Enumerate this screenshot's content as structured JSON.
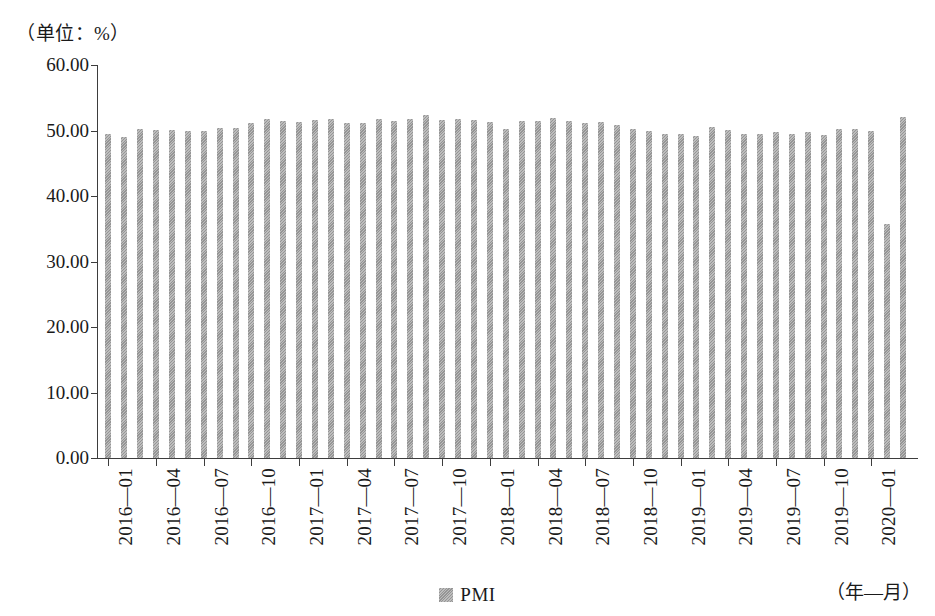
{
  "chart_data": {
    "type": "bar",
    "title": "",
    "unit_caption": "（单位：%）",
    "xlabel": "（年—月）",
    "ylabel": "",
    "grid": false,
    "legend_position": "bottom-center",
    "ylim": [
      0,
      60
    ],
    "ytick_labels": [
      "0.00",
      "10.00",
      "20.00",
      "30.00",
      "40.00",
      "50.00",
      "60.00"
    ],
    "ytick_values": [
      0,
      10,
      20,
      30,
      40,
      50,
      60
    ],
    "xtick_labels": [
      "2016—01",
      "2016—04",
      "2016—07",
      "2016—10",
      "2017—01",
      "2017—04",
      "2017—07",
      "2017—10",
      "2018—01",
      "2018—04",
      "2018—07",
      "2018—10",
      "2019—01",
      "2019—04",
      "2019—07",
      "2019—10",
      "2020—01"
    ],
    "xtick_indices": [
      0,
      3,
      6,
      9,
      12,
      15,
      18,
      21,
      24,
      27,
      30,
      33,
      36,
      39,
      42,
      45,
      48
    ],
    "series": [
      {
        "name": "PMI",
        "color": "#9d9d9d",
        "categories": [
          "2016-01",
          "2016-02",
          "2016-03",
          "2016-04",
          "2016-05",
          "2016-06",
          "2016-07",
          "2016-08",
          "2016-09",
          "2016-10",
          "2016-11",
          "2016-12",
          "2017-01",
          "2017-02",
          "2017-03",
          "2017-04",
          "2017-05",
          "2017-06",
          "2017-07",
          "2017-08",
          "2017-09",
          "2017-10",
          "2017-11",
          "2017-12",
          "2018-01",
          "2018-02",
          "2018-03",
          "2018-04",
          "2018-05",
          "2018-06",
          "2018-07",
          "2018-08",
          "2018-09",
          "2018-10",
          "2018-11",
          "2018-12",
          "2019-01",
          "2019-02",
          "2019-03",
          "2019-04",
          "2019-05",
          "2019-06",
          "2019-07",
          "2019-08",
          "2019-09",
          "2019-10",
          "2019-11",
          "2019-12",
          "2020-01",
          "2020-02",
          "2020-03"
        ],
        "values": [
          49.4,
          49.0,
          50.2,
          50.1,
          50.1,
          50.0,
          49.9,
          50.4,
          50.4,
          51.2,
          51.7,
          51.4,
          51.3,
          51.6,
          51.8,
          51.2,
          51.2,
          51.7,
          51.4,
          51.7,
          52.4,
          51.6,
          51.8,
          51.6,
          51.3,
          50.3,
          51.5,
          51.4,
          51.9,
          51.5,
          51.2,
          51.3,
          50.8,
          50.2,
          50.0,
          49.4,
          49.5,
          49.2,
          50.5,
          50.1,
          49.4,
          49.4,
          49.7,
          49.5,
          49.8,
          49.3,
          50.2,
          50.2,
          50.0,
          35.7,
          52.0
        ]
      }
    ]
  },
  "legend": {
    "items": [
      {
        "label": "PMI",
        "color": "#9d9d9d"
      }
    ]
  }
}
